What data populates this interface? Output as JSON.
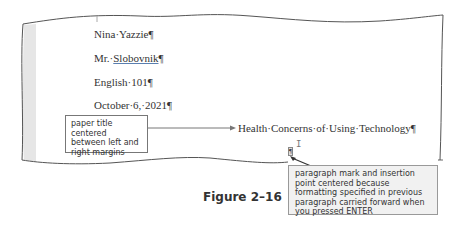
{
  "document": {
    "lines": [
      {
        "text_before": "Nina·Yazzie",
        "mark": "¶"
      },
      {
        "text_before": "Mr.·",
        "underlined": "Slobovnik",
        "mark": "¶"
      },
      {
        "text_before": "English·101",
        "mark": "¶"
      },
      {
        "text_before": "October·6,·2021",
        "mark": "¶"
      }
    ],
    "title": {
      "text": "Health·Concerns·of·Using·Technology",
      "mark": "¶"
    },
    "empty_paragraph_mark": "¶"
  },
  "callouts": {
    "left": "paper title centered between left and right margins",
    "right": "paragraph mark and insertion point centered because formatting specified in previous paragraph carried forward when you pressed ENTER"
  },
  "figure_caption": "Figure 2–16",
  "colors": {
    "page_border": "#555555",
    "left_margin_shade": "#e6e6e6",
    "callout_right_bg": "#f1f1f1",
    "spell_underline": "#5a7fb0"
  }
}
